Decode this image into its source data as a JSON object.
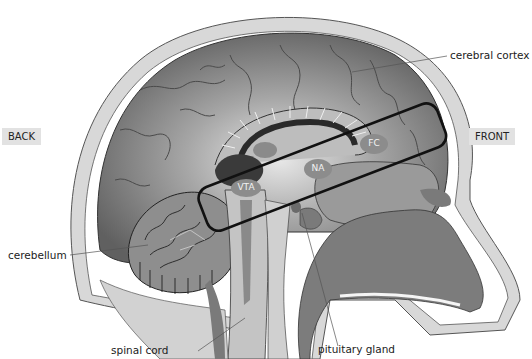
{
  "diagram": {
    "orientation": {
      "back": "BACK",
      "front": "FRONT"
    },
    "structure_labels": {
      "cerebral_cortex": "cerebral cortex",
      "cerebellum": "cerebellum",
      "spinal_cord": "spinal cord",
      "pituitary_gland": "pituitary gland"
    },
    "regions": {
      "vta": "VTA",
      "na": "NA",
      "fc": "FC"
    },
    "highlight": "rounded rectangle enclosing VTA, NA and FC (mesocorticolimbic pathway)",
    "colors": {
      "cortex_dark": "#6e6e6e",
      "cortex_light": "#c8c8c8",
      "skull": "#d4d4d4",
      "tissue_mid": "#9a9a9a",
      "nasal_dark": "#7a7a7a",
      "region_ellipse": "#8c8c8c",
      "outline": "#1a1a1a",
      "tag_bg": "#e2e2e2"
    }
  }
}
